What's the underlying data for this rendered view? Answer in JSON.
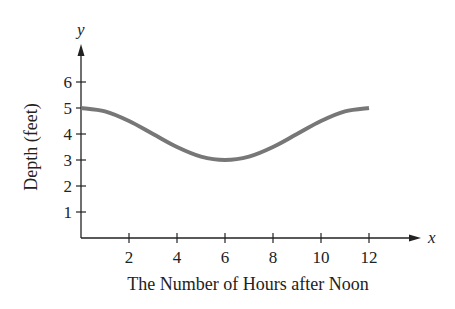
{
  "chart_data": {
    "type": "line",
    "title": "",
    "xlabel": "The Number of Hours after Noon",
    "ylabel": "Depth (feet)",
    "x_axis_symbol": "x",
    "y_axis_symbol": "y",
    "xlim": [
      0,
      14
    ],
    "ylim": [
      0,
      7
    ],
    "x_ticks": [
      2,
      4,
      6,
      8,
      10,
      12
    ],
    "y_ticks": [
      1,
      2,
      3,
      4,
      5,
      6
    ],
    "grid": false,
    "legend": null,
    "series": [
      {
        "name": "Depth",
        "color": "#777777",
        "x": [
          0,
          1,
          2,
          3,
          4,
          5,
          6,
          7,
          8,
          9,
          10,
          11,
          12
        ],
        "y": [
          5.0,
          4.87,
          4.5,
          4.0,
          3.5,
          3.13,
          3.0,
          3.13,
          3.5,
          4.0,
          4.5,
          4.87,
          5.0
        ]
      }
    ],
    "annotations": []
  },
  "labels": {
    "xlabel": "The Number of Hours after Noon",
    "ylabel": "Depth (feet)",
    "x_symbol": "x",
    "y_symbol": "y",
    "x_tick_labels": [
      "2",
      "4",
      "6",
      "8",
      "10",
      "12"
    ],
    "y_tick_labels": [
      "1",
      "2",
      "3",
      "4",
      "5",
      "6"
    ]
  }
}
